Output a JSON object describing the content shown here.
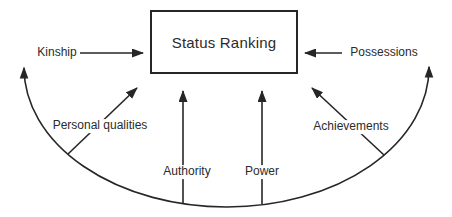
{
  "diagram": {
    "title_box": {
      "label": "Status Ranking"
    },
    "factors": {
      "kinship": "Kinship",
      "possessions": "Possessions",
      "personal_qualities": "Personal qualities",
      "achievements": "Achievements",
      "authority": "Authority",
      "power": "Power"
    },
    "edges": [
      {
        "from": "Kinship",
        "to": "Status Ranking",
        "style": "horizontal arrow, left to box"
      },
      {
        "from": "Possessions",
        "to": "Status Ranking",
        "style": "horizontal arrow, right to box"
      },
      {
        "from": "Personal qualities",
        "to": "Status Ranking",
        "style": "diagonal arrow rising right"
      },
      {
        "from": "Achievements",
        "to": "Status Ranking",
        "style": "diagonal arrow rising left"
      },
      {
        "from": "Authority",
        "to": "Status Ranking",
        "style": "vertical arrow"
      },
      {
        "from": "Power",
        "to": "Status Ranking",
        "style": "vertical arrow"
      },
      {
        "from": "base arc",
        "to": "both outer ends",
        "style": "curved line under diagram with up-pointing arrowheads at both ends"
      }
    ],
    "colors": {
      "ink": "#262626",
      "background": "#ffffff"
    }
  }
}
